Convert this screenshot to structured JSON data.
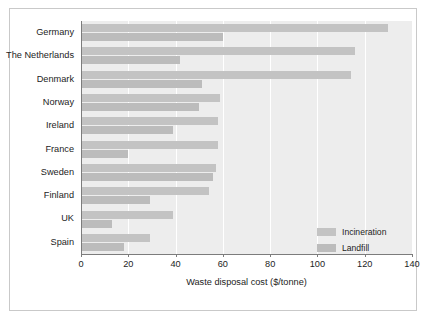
{
  "figure": {
    "frame_color": "#c9c9c9",
    "plot_background": "#ededed",
    "gridline_color": "#ffffff",
    "axis_color": "#7c7c7c"
  },
  "legend": {
    "position": "bottom-right",
    "entries": [
      {
        "label": "Incineration",
        "color": "#c3c3c3"
      },
      {
        "label": "Landfill",
        "color": "#bcbcbc"
      }
    ]
  },
  "chart_data": {
    "type": "bar",
    "orientation": "horizontal",
    "title": "",
    "xlabel": "Waste disposal cost ($/tonne)",
    "ylabel": "",
    "xlim": [
      0,
      140
    ],
    "xticks": [
      0,
      20,
      40,
      60,
      80,
      100,
      120,
      140
    ],
    "xtick_labels": [
      "0",
      "20",
      "40",
      "60",
      "80",
      "100",
      "120",
      "140"
    ],
    "grid": true,
    "grid_axis": "x",
    "legend_position": "lower right",
    "categories": [
      "Germany",
      "The Netherlands",
      "Denmark",
      "Norway",
      "Ireland",
      "France",
      "Sweden",
      "Finland",
      "UK",
      "Spain"
    ],
    "series": [
      {
        "name": "Incineration",
        "color": "#c3c3c3",
        "values": [
          130,
          116,
          114,
          59,
          58,
          58,
          57,
          54,
          39,
          29
        ]
      },
      {
        "name": "Landfill",
        "color": "#bcbcbc",
        "values": [
          60,
          42,
          51,
          50,
          39,
          20,
          56,
          29,
          13,
          18
        ]
      }
    ]
  }
}
